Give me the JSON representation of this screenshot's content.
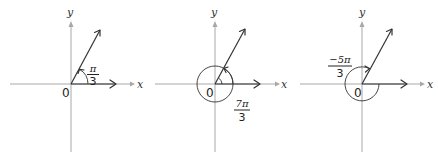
{
  "figure": {
    "panels": [
      {
        "id": "panel-1",
        "x_label": "x",
        "y_label": "y",
        "origin_label": "0",
        "angle_label": {
          "numerator": "π",
          "denominator": "3"
        },
        "angle_radians_text": "π/3",
        "direction": "counterclockwise",
        "full_rotations": 0
      },
      {
        "id": "panel-2",
        "x_label": "x",
        "y_label": "y",
        "origin_label": "0",
        "angle_label": {
          "numerator": "7π",
          "denominator": "3"
        },
        "angle_radians_text": "7π/3",
        "direction": "counterclockwise",
        "full_rotations": 1
      },
      {
        "id": "panel-3",
        "x_label": "x",
        "y_label": "y",
        "origin_label": "0",
        "angle_label": {
          "numerator": "−5π",
          "denominator": "3"
        },
        "angle_radians_text": "−5π/3",
        "direction": "clockwise",
        "full_rotations": 0
      }
    ],
    "colors": {
      "axis": "#a8a8a8",
      "ray": "#333333",
      "text": "#222222"
    }
  }
}
